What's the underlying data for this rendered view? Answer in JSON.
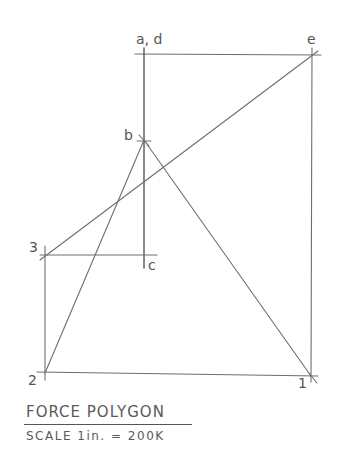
{
  "diagram": {
    "type": "force-polygon",
    "title": "FORCE POLYGON",
    "scale": "SCALE 1in. = 200K",
    "line_color": "#6e6e6e",
    "background": "#ffffff",
    "points": {
      "a_d": {
        "label": "a, d",
        "x": 144,
        "y": 54
      },
      "e": {
        "label": "e",
        "x": 312,
        "y": 54
      },
      "b": {
        "label": "b",
        "x": 144,
        "y": 140
      },
      "c": {
        "label": "c",
        "x": 144,
        "y": 255
      },
      "3": {
        "label": "3",
        "x": 45,
        "y": 255
      },
      "2": {
        "label": "2",
        "x": 45,
        "y": 373
      },
      "1": {
        "label": "1",
        "x": 311,
        "y": 376
      }
    },
    "segments": [
      {
        "from": "a_d",
        "to": "e",
        "desc": "top horizontal"
      },
      {
        "from": "a_d",
        "to": "c",
        "desc": "left vertical load line"
      },
      {
        "from": "e",
        "to": "1",
        "desc": "right vertical"
      },
      {
        "from": "2",
        "to": "1",
        "desc": "bottom horizontal"
      },
      {
        "from": "3",
        "to": "2",
        "desc": "left vertical"
      },
      {
        "from": "3",
        "to": "c",
        "desc": "horizontal 3-c"
      },
      {
        "from": "3",
        "to": "e",
        "desc": "diagonal 3-e"
      },
      {
        "from": "b",
        "to": "2",
        "desc": "diagonal b-2"
      },
      {
        "from": "b",
        "to": "1",
        "desc": "diagonal b-1"
      }
    ]
  },
  "labels": {
    "a_d": "a, d",
    "e": "e",
    "b": "b",
    "c": "c",
    "p3": "3",
    "p2": "2",
    "p1": "1"
  },
  "title": {
    "main": "FORCE POLYGON",
    "scale": "SCALE  1in. = 200K"
  }
}
